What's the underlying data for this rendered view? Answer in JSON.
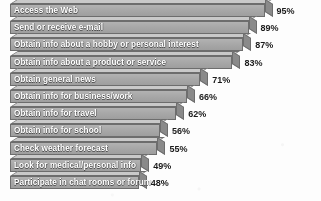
{
  "chart_data": {
    "type": "bar",
    "orientation": "horizontal",
    "title": "",
    "subtitle": "",
    "xlabel": "",
    "ylabel": "",
    "xlim": [
      0,
      100
    ],
    "grid": false,
    "legend": null,
    "value_suffix": "%",
    "categories": [
      "Access the Web",
      "Send or receive e-mail",
      "Obtain info about a hobby or personal interest",
      "Obtain info about a product or service",
      "Obtain general news",
      "Obtain info for business/work",
      "Obtain info for travel",
      "Obtain info for school",
      "Check weather forecast",
      "Look for medical/personal info",
      "Participate in chat rooms or forum"
    ],
    "values": [
      95,
      89,
      87,
      83,
      71,
      66,
      62,
      56,
      55,
      49,
      48
    ],
    "value_labels": [
      "95%",
      "89%",
      "87%",
      "83%",
      "71%",
      "66%",
      "62%",
      "56%",
      "55%",
      "49%",
      "48%"
    ],
    "style": {
      "bar_face_color": "#a8a8a8",
      "bar_top_color": "#c9c9c9",
      "bar_side_color": "#8a8a8a",
      "bar_outline_color": "#6d6d6d",
      "bar_label_color": "#ffffff",
      "value_label_color": "#1b1b1b",
      "background_color": "#fdfdfd",
      "three_d": true
    }
  }
}
